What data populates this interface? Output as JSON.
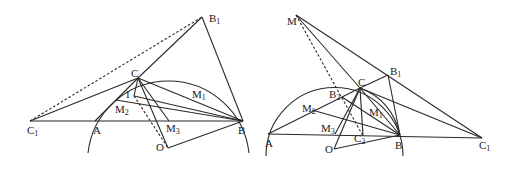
{
  "figures": [
    {
      "id": "left",
      "points": {
        "C1": {
          "label": "C",
          "sub": "1",
          "x": 30,
          "y": 121
        },
        "A": {
          "label": "A",
          "x": 95,
          "y": 121
        },
        "B": {
          "label": "B",
          "x": 243,
          "y": 121
        },
        "C": {
          "label": "C",
          "x": 138,
          "y": 78
        },
        "B1": {
          "label": "B",
          "sub": "1",
          "x": 202,
          "y": 17
        },
        "I": {
          "label": "I",
          "x": 134,
          "y": 96
        },
        "M1": {
          "label": "M",
          "sub": "1",
          "x": 195,
          "y": 90
        },
        "M2": {
          "label": "M",
          "sub": "2",
          "x": 116,
          "y": 100
        },
        "M3": {
          "label": "M",
          "sub": "3",
          "x": 169,
          "y": 121
        },
        "O": {
          "label": "O",
          "x": 168,
          "y": 148
        }
      }
    },
    {
      "id": "right",
      "points": {
        "M": {
          "label": "M",
          "x": 296,
          "y": 15
        },
        "B1": {
          "label": "B",
          "sub": "1",
          "x": 388,
          "y": 75
        },
        "C": {
          "label": "C",
          "x": 360,
          "y": 88
        },
        "B2": {
          "label": "B",
          "sub": "2",
          "x": 342,
          "y": 97
        },
        "M2": {
          "label": "M",
          "sub": "2",
          "x": 312,
          "y": 110
        },
        "M1": {
          "label": "M",
          "sub": "1",
          "x": 373,
          "y": 110
        },
        "M3": {
          "label": "M",
          "sub": "3",
          "x": 335,
          "y": 134
        },
        "A": {
          "label": "A",
          "x": 268,
          "y": 134
        },
        "C2": {
          "label": "C",
          "sub": "2",
          "x": 363,
          "y": 136
        },
        "B": {
          "label": "B",
          "x": 400,
          "y": 135
        },
        "O": {
          "label": "O",
          "x": 334,
          "y": 149
        },
        "C1": {
          "label": "C",
          "sub": "1",
          "x": 482,
          "y": 138
        }
      }
    }
  ]
}
